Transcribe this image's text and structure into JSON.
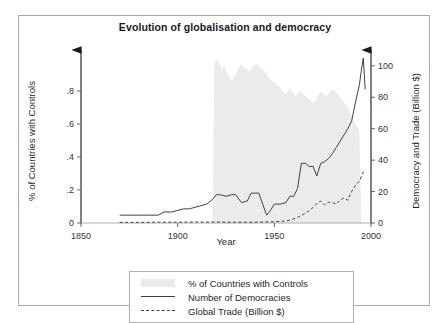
{
  "figure": {
    "title": "Evolution of globalisation and democracy",
    "top_fragment": ""
  },
  "legend": {
    "items": [
      {
        "label": "% of Countries with Controls",
        "key": "area-swatch-icon",
        "style": "area"
      },
      {
        "label": "Number of Democracies",
        "key": "solid-line-icon",
        "style": "solid"
      },
      {
        "label": "Global Trade (Billion $)",
        "key": "dashed-line-icon",
        "style": "dashed"
      }
    ]
  },
  "chart_data": {
    "type": "line",
    "title": "Evolution of globalisation and democracy",
    "xlabel": "Year",
    "ylabel_left": "% of Countries with Controls",
    "ylabel_right": "Democracy and Trade (Billion $)",
    "xlim": [
      1850,
      2000
    ],
    "xticks": [
      1850,
      1900,
      1950,
      2000
    ],
    "ylim_left": [
      0,
      1.0
    ],
    "yticks_left": [
      0,
      0.2,
      0.4,
      0.6,
      0.8
    ],
    "ytick_labels_left": [
      "0",
      ".2",
      ".4",
      ".6",
      ".8"
    ],
    "ylim_right": [
      0,
      105
    ],
    "yticks_right": [
      0,
      20,
      40,
      60,
      80,
      100
    ],
    "ytick_labels_right": [
      "0",
      "20",
      "40",
      "60",
      "80",
      "100"
    ],
    "grid": false,
    "legend_position": "below-plot",
    "series": [
      {
        "name": "% of Countries with Controls",
        "type": "area",
        "axis": "left",
        "color": "#ebebeb",
        "x": [
          1918,
          1919,
          1920,
          1921,
          1922,
          1923,
          1924,
          1925,
          1926,
          1927,
          1928,
          1929,
          1930,
          1931,
          1932,
          1933,
          1934,
          1935,
          1936,
          1937,
          1938,
          1939,
          1940,
          1941,
          1942,
          1943,
          1944,
          1945,
          1946,
          1947,
          1948,
          1949,
          1950,
          1951,
          1952,
          1953,
          1954,
          1955,
          1956,
          1957,
          1958,
          1959,
          1960,
          1961,
          1962,
          1963,
          1964,
          1965,
          1966,
          1967,
          1968,
          1969,
          1970,
          1971,
          1972,
          1973,
          1974,
          1975,
          1976,
          1977,
          1978,
          1979,
          1980,
          1981,
          1982,
          1983,
          1984,
          1985,
          1986,
          1987,
          1988,
          1989,
          1990,
          1991,
          1992,
          1993,
          1994,
          1995
        ],
        "values": [
          0.0,
          0.97,
          0.99,
          0.98,
          0.95,
          0.93,
          0.96,
          0.92,
          0.9,
          0.88,
          0.86,
          0.88,
          0.9,
          0.93,
          0.95,
          0.96,
          0.95,
          0.94,
          0.93,
          0.92,
          0.93,
          0.95,
          0.96,
          0.96,
          0.95,
          0.94,
          0.93,
          0.92,
          0.9,
          0.88,
          0.87,
          0.86,
          0.85,
          0.84,
          0.83,
          0.82,
          0.8,
          0.79,
          0.78,
          0.8,
          0.82,
          0.8,
          0.78,
          0.77,
          0.78,
          0.8,
          0.79,
          0.78,
          0.77,
          0.76,
          0.75,
          0.74,
          0.73,
          0.74,
          0.76,
          0.78,
          0.8,
          0.79,
          0.78,
          0.77,
          0.78,
          0.8,
          0.81,
          0.8,
          0.79,
          0.78,
          0.76,
          0.75,
          0.73,
          0.72,
          0.7,
          0.68,
          0.65,
          0.62,
          0.6,
          0.58,
          0.56,
          0.0
        ]
      },
      {
        "name": "Number of Democracies",
        "type": "line",
        "axis": "right",
        "color": "#404040",
        "dash": "solid",
        "x": [
          1870,
          1878,
          1885,
          1890,
          1893,
          1897,
          1900,
          1903,
          1906,
          1909,
          1912,
          1915,
          1918,
          1920,
          1922,
          1925,
          1928,
          1930,
          1933,
          1936,
          1938,
          1940,
          1942,
          1944,
          1946,
          1948,
          1950,
          1953,
          1956,
          1958,
          1960,
          1962,
          1964,
          1966,
          1968,
          1970,
          1972,
          1974,
          1976,
          1978,
          1980,
          1982,
          1984,
          1986,
          1988,
          1990,
          1992,
          1994,
          1995,
          1996,
          1997
        ],
        "values": [
          5,
          5,
          5,
          5,
          7,
          7,
          8,
          9,
          9,
          10,
          11,
          12,
          15,
          18,
          18,
          17,
          18,
          18,
          13,
          14,
          19,
          19,
          19,
          12,
          5,
          8,
          12,
          12,
          13,
          17,
          17,
          22,
          38,
          38,
          36,
          36,
          30,
          38,
          39,
          41,
          44,
          48,
          52,
          56,
          60,
          65,
          77,
          88,
          97,
          105,
          85
        ]
      },
      {
        "name": "Global Trade (Billion $)",
        "type": "line",
        "axis": "right",
        "color": "#404040",
        "dash": "dashed",
        "x": [
          1870,
          1880,
          1890,
          1900,
          1910,
          1920,
          1930,
          1940,
          1950,
          1955,
          1958,
          1960,
          1962,
          1964,
          1966,
          1968,
          1970,
          1972,
          1974,
          1976,
          1978,
          1980,
          1982,
          1984,
          1986,
          1988,
          1990,
          1992,
          1994,
          1996,
          1997
        ],
        "values": [
          0.4,
          0.4,
          0.5,
          0.5,
          0.6,
          0.6,
          0.5,
          0.5,
          0.8,
          1.2,
          1.8,
          2.6,
          3.6,
          4.8,
          6.2,
          7.8,
          9.8,
          12.4,
          14.0,
          11.5,
          13.2,
          13.0,
          12.0,
          14.5,
          16.0,
          14.5,
          20.0,
          24.0,
          26.5,
          32.5,
          32.0
        ]
      }
    ],
    "annotations": [
      {
        "text": "Year",
        "x": 1925,
        "position": "x-axis-inline"
      }
    ]
  }
}
